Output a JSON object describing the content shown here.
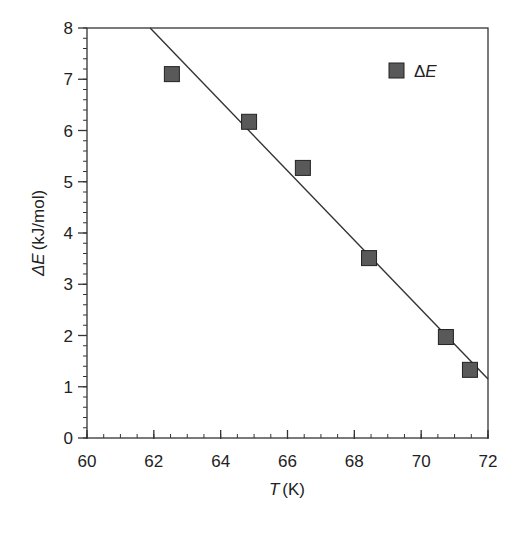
{
  "chart_data": {
    "type": "scatter",
    "title": "",
    "xlabel": "T (K)",
    "xlabel_italic_part": "T",
    "xlabel_unit": "(K)",
    "ylabel": "ΔE (kJ/mol)",
    "ylabel_italic_part": "ΔE",
    "ylabel_unit": "(kJ/mol)",
    "xlim": [
      60,
      72
    ],
    "ylim": [
      0,
      8
    ],
    "x_ticks": [
      60,
      62,
      64,
      66,
      68,
      70,
      72
    ],
    "y_ticks": [
      0,
      1,
      2,
      3,
      4,
      5,
      6,
      7,
      8
    ],
    "x_minor_step": 0.5,
    "y_minor_step": 0.2,
    "grid": false,
    "legend_position": "upper right",
    "series": [
      {
        "name": "ΔE",
        "marker": "square",
        "color": "#595959",
        "edge_color": "#222222",
        "x": [
          62.54,
          64.85,
          66.46,
          68.44,
          70.74,
          71.46
        ],
        "y": [
          7.1,
          6.17,
          5.27,
          3.51,
          1.97,
          1.33
        ]
      },
      {
        "name": "linear fit",
        "type": "line",
        "color": "#333333",
        "x": [
          61.89,
          72.0
        ],
        "y": [
          8.0,
          1.15
        ]
      }
    ]
  },
  "legend": {
    "label_delta": "Δ",
    "label_var": "E"
  }
}
